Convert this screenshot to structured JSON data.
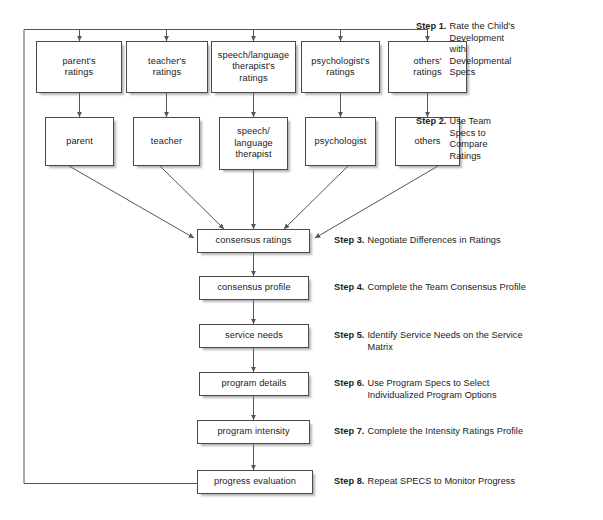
{
  "diagram": {
    "stroke_color": "#4a4a4a",
    "line_color": "#555555",
    "background": "#ffffff",
    "text_color": "#1b1b1b"
  },
  "ratings_row": [
    {
      "id": "parents-ratings",
      "label": "parent's\nratings"
    },
    {
      "id": "teachers-ratings",
      "label": "teacher's\nratings"
    },
    {
      "id": "slt-ratings",
      "label": "speech/language\ntherapist's\nratings"
    },
    {
      "id": "psychologist-ratings",
      "label": "psychologist's\nratings"
    },
    {
      "id": "others-ratings",
      "label": "others'\nratings"
    }
  ],
  "people_row": [
    {
      "id": "parent",
      "label": "parent"
    },
    {
      "id": "teacher",
      "label": "teacher"
    },
    {
      "id": "slt",
      "label": "speech/\nlanguage\ntherapist"
    },
    {
      "id": "psychologist",
      "label": "psychologist"
    },
    {
      "id": "others",
      "label": "others"
    }
  ],
  "chain": [
    {
      "id": "consensus-ratings",
      "label": "consensus ratings"
    },
    {
      "id": "consensus-profile",
      "label": "consensus profile"
    },
    {
      "id": "service-needs",
      "label": "service needs"
    },
    {
      "id": "program-details",
      "label": "program details"
    },
    {
      "id": "program-intensity",
      "label": "program intensity"
    },
    {
      "id": "progress-evaluation",
      "label": "progress evaluation"
    }
  ],
  "steps": [
    {
      "id": "step-1",
      "label": "Step 1.",
      "text": "Rate the Child's\nDevelopment\nwith\nDevelopmental\nSpecs"
    },
    {
      "id": "step-2",
      "label": "Step 2.",
      "text": "Use Team\nSpecs to\nCompare\nRatings"
    },
    {
      "id": "step-3",
      "label": "Step 3.",
      "text": "Negotiate Differences in Ratings"
    },
    {
      "id": "step-4",
      "label": "Step 4.",
      "text": "Complete the Team Consensus Profile"
    },
    {
      "id": "step-5",
      "label": "Step 5.",
      "text": "Identify Service Needs on the Service\nMatrix"
    },
    {
      "id": "step-6",
      "label": "Step 6.",
      "text": "Use Program Specs to Select\nIndividualized Program Options"
    },
    {
      "id": "step-7",
      "label": "Step 7.",
      "text": "Complete the Intensity Ratings Profile"
    },
    {
      "id": "step-8",
      "label": "Step 8.",
      "text": "Repeat SPECS to Monitor Progress"
    }
  ]
}
